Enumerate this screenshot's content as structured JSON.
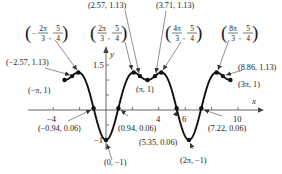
{
  "chart_data": {
    "type": "line",
    "title": "",
    "function": "f(x) = sin^2(x) - cos(x)",
    "xlabel": "x",
    "ylabel": "y",
    "xlim": [
      -3.1416,
      9.4248
    ],
    "ylim": [
      -1,
      1.5
    ],
    "x_ticks": [
      -4,
      -2,
      2,
      4,
      6,
      8,
      10
    ],
    "x_tick_labels": [
      {
        "value": -4,
        "label": "−4"
      },
      {
        "value": 4,
        "label": "4"
      },
      {
        "value": 6,
        "label": "6"
      },
      {
        "value": 10,
        "label": "10"
      }
    ],
    "y_ticks": [
      -0.5,
      0.5,
      1,
      1.5
    ],
    "y_tick_labels": [
      {
        "value": 1.5,
        "label": "1.5"
      },
      {
        "value": -1,
        "label": "−1"
      }
    ],
    "grid": false,
    "line_color": "#111111",
    "points": [
      {
        "x": -3.1416,
        "y": 1,
        "label": "(−π, 1)"
      },
      {
        "x": -2.57,
        "y": 1.13,
        "label": "(−2.57, 1.13)"
      },
      {
        "x": -2.0944,
        "y": 1.25,
        "label_frac": {
          "sign": "−",
          "num": "2π",
          "den": "3",
          "ynum": "5",
          "yden": "4"
        }
      },
      {
        "x": -0.94,
        "y": 0.06,
        "label": "(−0.94, 0.06)"
      },
      {
        "x": 0,
        "y": -1,
        "label": "(0, −1)"
      },
      {
        "x": 0.94,
        "y": 0.06,
        "label": "(0.94, 0.06)"
      },
      {
        "x": 2.0944,
        "y": 1.25,
        "label_frac": {
          "sign": "",
          "num": "2π",
          "den": "3",
          "ynum": "5",
          "yden": "4"
        }
      },
      {
        "x": 2.57,
        "y": 1.13,
        "label": "(2.57, 1.13)"
      },
      {
        "x": 3.1416,
        "y": 1,
        "label": "(π, 1)"
      },
      {
        "x": 3.71,
        "y": 1.13,
        "label": "(3.71, 1.13)"
      },
      {
        "x": 4.1888,
        "y": 1.25,
        "label_frac": {
          "sign": "",
          "num": "4π",
          "den": "3",
          "ynum": "5",
          "yden": "4"
        }
      },
      {
        "x": 5.35,
        "y": 0.06,
        "label": "(5.35, 0.06)"
      },
      {
        "x": 6.2832,
        "y": -1,
        "label": "(2π, −1)"
      },
      {
        "x": 7.22,
        "y": 0.06,
        "label": "(7.22, 0.06)"
      },
      {
        "x": 8.3776,
        "y": 1.25,
        "label_frac": {
          "sign": "",
          "num": "8π",
          "den": "3",
          "ynum": "5",
          "yden": "4"
        }
      },
      {
        "x": 8.86,
        "y": 1.13,
        "label": "(8.86, 1.13)"
      },
      {
        "x": 9.4248,
        "y": 1,
        "label": "(3π, 1)"
      }
    ]
  },
  "labels": {
    "axis_x": "x",
    "axis_y": "y",
    "tick_neg4": "−4",
    "tick_4": "4",
    "tick_6": "6",
    "tick_10": "10",
    "tick_1_5": "1.5",
    "tick_neg1": "−1",
    "p_neg_pi": "(−π, 1)",
    "p_neg257": "(−2.57, 1.13)",
    "p_neg094": "(−0.94, 0.06)",
    "p_0": "(0, −1)",
    "p_094": "(0.94, 0.06)",
    "p_257": "(2.57, 1.13)",
    "p_pi": "(π, 1)",
    "p_371": "(3.71, 1.13)",
    "p_535": "(5.35, 0.06)",
    "p_2pi": "(2π, −1)",
    "p_722": "(7.22, 0.06)",
    "p_886": "(8.86, 1.13)",
    "p_3pi": "(3π, 1)",
    "f_neg2pi3": {
      "sign": "−",
      "num": "2π",
      "den": "3",
      "ynum": "5",
      "yden": "4"
    },
    "f_2pi3": {
      "num": "2π",
      "den": "3",
      "ynum": "5",
      "yden": "4"
    },
    "f_4pi3": {
      "num": "4π",
      "den": "3",
      "ynum": "5",
      "yden": "4"
    },
    "f_8pi3": {
      "num": "8π",
      "den": "3",
      "ynum": "5",
      "yden": "4"
    }
  }
}
